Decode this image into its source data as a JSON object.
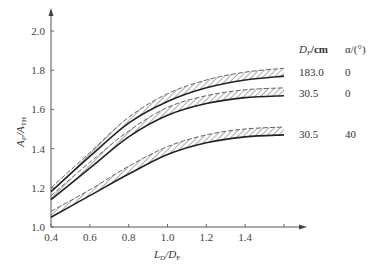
{
  "chart_data": {
    "type": "area",
    "title": "",
    "xlabel": "L_D/D_F",
    "ylabel": "A_P/A_TH",
    "xlim": [
      0.4,
      1.6
    ],
    "ylim": [
      1.0,
      2.0
    ],
    "x_ticks": [
      "0.4",
      "0.6",
      "0.8",
      "1.0",
      "1.2",
      "1.4"
    ],
    "y_ticks": [
      "1.0",
      "1.2",
      "1.4",
      "1.6",
      "1.8",
      "2.0"
    ],
    "grid": false,
    "legend_position": "right, inline table",
    "legend_headers": {
      "col1": "D_F/cm",
      "col2": "α/(°)"
    },
    "x": [
      0.4,
      0.6,
      0.8,
      1.0,
      1.2,
      1.4,
      1.6
    ],
    "series": [
      {
        "name": "D_F=183.0 cm, α=0°",
        "d_f": "183.0",
        "alpha": "0",
        "upper": [
          1.2,
          1.38,
          1.56,
          1.68,
          1.75,
          1.79,
          1.81
        ],
        "lower": [
          1.18,
          1.36,
          1.53,
          1.64,
          1.71,
          1.75,
          1.77
        ]
      },
      {
        "name": "D_F=30.5 cm, α=0°",
        "d_f": "30.5",
        "alpha": "0",
        "upper": [
          1.16,
          1.33,
          1.49,
          1.61,
          1.67,
          1.7,
          1.71
        ],
        "lower": [
          1.14,
          1.3,
          1.46,
          1.57,
          1.63,
          1.66,
          1.67
        ]
      },
      {
        "name": "D_F=30.5 cm, α=40°",
        "d_f": "30.5",
        "alpha": "40",
        "upper": [
          1.08,
          1.19,
          1.31,
          1.41,
          1.47,
          1.5,
          1.51
        ],
        "lower": [
          1.05,
          1.16,
          1.27,
          1.37,
          1.43,
          1.46,
          1.47
        ]
      }
    ]
  },
  "axes": {
    "y_label_main": "A",
    "y_label_sub1": "P",
    "y_label_sep": "/A",
    "y_label_sub2": "TH",
    "x_label_main": "L",
    "x_label_sub1": "D",
    "x_label_sep": "/D",
    "x_label_sub2": "F"
  },
  "legend": {
    "header_df": "D",
    "header_df_sub": "F",
    "header_df_unit": "/cm",
    "header_alpha": "α/(°)",
    "rows": [
      {
        "df": "183.0",
        "alpha": "0"
      },
      {
        "df": "30.5",
        "alpha": "0"
      },
      {
        "df": "30.5",
        "alpha": "40"
      }
    ]
  }
}
